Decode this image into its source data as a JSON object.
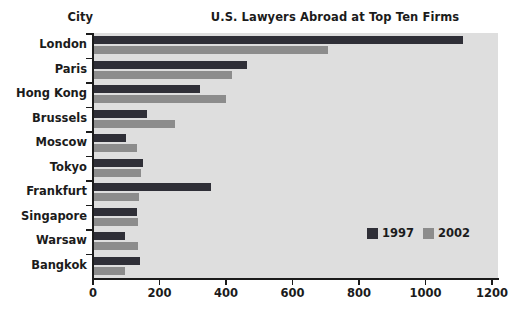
{
  "chart_data": {
    "type": "bar",
    "orientation": "horizontal",
    "title": "U.S. Lawyers Abroad at Top Ten Firms",
    "xlabel": "",
    "ylabel": "City",
    "categories": [
      "London",
      "Paris",
      "Hong Kong",
      "Brussels",
      "Moscow",
      "Tokyo",
      "Frankfurt",
      "Singapore",
      "Warsaw",
      "Bangkok"
    ],
    "series": [
      {
        "name": "1997",
        "color": "#2f2f37",
        "values": [
          1113,
          463,
          322,
          162,
          100,
          150,
          355,
          132,
          96,
          141
        ]
      },
      {
        "name": "2002",
        "color": "#8c8c8c",
        "values": [
          707,
          418,
          400,
          247,
          132,
          144,
          138,
          135,
          135,
          96
        ]
      }
    ],
    "xlim": [
      0,
      1200
    ],
    "xticks": [
      0,
      200,
      400,
      600,
      800,
      1000,
      1200
    ],
    "xtick_labels": [
      "0",
      "200",
      "400",
      "600",
      "800",
      "1000",
      "1200"
    ],
    "grid": false,
    "legend_position": "inside-lower-right",
    "plot_background": "#dedede"
  },
  "legend": {
    "items": [
      {
        "label": "1997",
        "color": "#2f2f37"
      },
      {
        "label": "2002",
        "color": "#8c8c8c"
      }
    ]
  }
}
